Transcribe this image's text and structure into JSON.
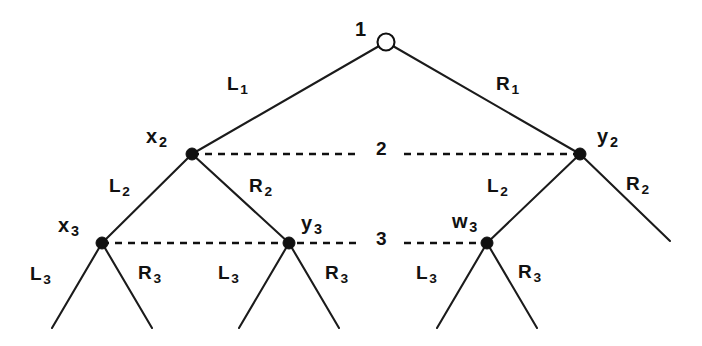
{
  "figure": {
    "background_color": "#ffffff",
    "line_color": "#101010",
    "canvas": {
      "width": 702,
      "height": 346
    }
  },
  "nodes": [
    {
      "id": "root",
      "label_main": "",
      "label_sub": "",
      "kind": "hollow",
      "x": 386,
      "y": 42,
      "r": 8.5
    },
    {
      "id": "x2",
      "label_main": "x",
      "label_sub": "2",
      "kind": "filled",
      "x": 192,
      "y": 154,
      "r": 6.0
    },
    {
      "id": "y2",
      "label_main": "y",
      "label_sub": "2",
      "kind": "filled",
      "x": 580,
      "y": 154,
      "r": 6.0
    },
    {
      "id": "x3",
      "label_main": "x",
      "label_sub": "3",
      "kind": "filled",
      "x": 102,
      "y": 243,
      "r": 6.0
    },
    {
      "id": "y3",
      "label_main": "y",
      "label_sub": "3",
      "kind": "filled",
      "x": 289,
      "y": 243,
      "r": 6.0
    },
    {
      "id": "w3",
      "label_main": "w",
      "label_sub": "3",
      "kind": "filled",
      "x": 487,
      "y": 243,
      "r": 6.0
    }
  ],
  "node_labels": {
    "root": {
      "text": "1",
      "sub": "",
      "x": 355,
      "y": 19
    },
    "x2": {
      "text": "x",
      "sub": "2",
      "x": 146,
      "y": 126
    },
    "y2": {
      "text": "y",
      "sub": "2",
      "x": 597,
      "y": 126
    },
    "x3": {
      "text": "x",
      "sub": "3",
      "x": 58,
      "y": 215
    },
    "y3": {
      "text": "y",
      "sub": "3",
      "x": 301,
      "y": 213
    },
    "w3": {
      "text": "w",
      "sub": "3",
      "x": 452,
      "y": 211
    }
  },
  "edge_labels": [
    {
      "id": "L1",
      "text": "L",
      "sub": "1",
      "x": 227,
      "y": 74
    },
    {
      "id": "R1",
      "text": "R",
      "sub": "1",
      "x": 496,
      "y": 74
    },
    {
      "id": "L2-left",
      "text": "L",
      "sub": "2",
      "x": 109,
      "y": 176
    },
    {
      "id": "R2-left",
      "text": "R",
      "sub": "2",
      "x": 249,
      "y": 176
    },
    {
      "id": "L2-right",
      "text": "L",
      "sub": "2",
      "x": 487,
      "y": 176
    },
    {
      "id": "R2-right",
      "text": "R",
      "sub": "2",
      "x": 626,
      "y": 174
    },
    {
      "id": "L3-a",
      "text": "L",
      "sub": "3",
      "x": 30,
      "y": 264
    },
    {
      "id": "R3-a",
      "text": "R",
      "sub": "3",
      "x": 138,
      "y": 263
    },
    {
      "id": "L3-b",
      "text": "L",
      "sub": "3",
      "x": 218,
      "y": 263
    },
    {
      "id": "R3-b",
      "text": "R",
      "sub": "3",
      "x": 325,
      "y": 263
    },
    {
      "id": "L3-c",
      "text": "L",
      "sub": "3",
      "x": 416,
      "y": 263
    },
    {
      "id": "R3-c",
      "text": "R",
      "sub": "3",
      "x": 518,
      "y": 262
    }
  ],
  "level_links": [
    {
      "id": "level-2-link",
      "label": "2",
      "label_x": 376,
      "label_y": 139,
      "from_x": 192,
      "from_y": 154,
      "to_x": 580,
      "to_y": 154,
      "gap_start": 358,
      "gap_end": 404
    },
    {
      "id": "level-3-link",
      "label": "3",
      "label_x": 376,
      "label_y": 229,
      "from_x": 102,
      "from_y": 243,
      "to_x": 487,
      "to_y": 243,
      "gap_start": 358,
      "gap_end": 404
    }
  ],
  "edges": [
    {
      "id": "edge-L1",
      "x1": 386,
      "y1": 42,
      "x2": 192,
      "y2": 154
    },
    {
      "id": "edge-R1",
      "x1": 386,
      "y1": 42,
      "x2": 580,
      "y2": 154
    },
    {
      "id": "edge-L2-left",
      "x1": 192,
      "y1": 154,
      "x2": 102,
      "y2": 243
    },
    {
      "id": "edge-R2-left",
      "x1": 192,
      "y1": 154,
      "x2": 289,
      "y2": 243
    },
    {
      "id": "edge-L2-right",
      "x1": 580,
      "y1": 154,
      "x2": 487,
      "y2": 243
    },
    {
      "id": "edge-R2-right",
      "x1": 580,
      "y1": 154,
      "x2": 670,
      "y2": 241
    },
    {
      "id": "edge-L3-a",
      "x1": 102,
      "y1": 243,
      "x2": 52,
      "y2": 328
    },
    {
      "id": "edge-R3-a",
      "x1": 102,
      "y1": 243,
      "x2": 152,
      "y2": 328
    },
    {
      "id": "edge-L3-b",
      "x1": 289,
      "y1": 243,
      "x2": 239,
      "y2": 328
    },
    {
      "id": "edge-R3-b",
      "x1": 289,
      "y1": 243,
      "x2": 339,
      "y2": 328
    },
    {
      "id": "edge-L3-c",
      "x1": 487,
      "y1": 243,
      "x2": 437,
      "y2": 328
    },
    {
      "id": "edge-R3-c",
      "x1": 487,
      "y1": 243,
      "x2": 537,
      "y2": 328
    }
  ]
}
